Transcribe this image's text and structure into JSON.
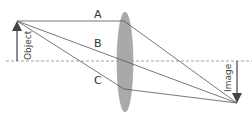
{
  "diagram": {
    "type": "converging-lens ray diagram",
    "labels": {
      "ray_a": "A",
      "ray_b": "B",
      "ray_c": "C",
      "object": "Object",
      "image": "Image"
    },
    "colors": {
      "lens_fill": "#a9a9a9",
      "ray": "#555555",
      "axis": "#888888",
      "arrow": "#444444"
    },
    "rays": [
      {
        "name": "A",
        "description": "parallel to axis, refracts through focal point"
      },
      {
        "name": "B",
        "description": "through lens centre, undeviated"
      },
      {
        "name": "C",
        "description": "through near focal point, emerges parallel"
      }
    ]
  }
}
